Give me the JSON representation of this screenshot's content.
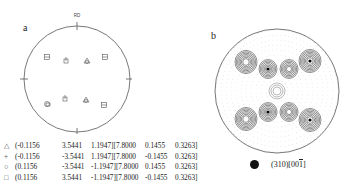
{
  "figure_a": {
    "label": "a",
    "axis_label_top": "RD",
    "symbols": [
      {
        "type": "square-hatched",
        "pos": "upper-left"
      },
      {
        "type": "cross",
        "pos": "upper-inner-left"
      },
      {
        "type": "triangle",
        "pos": "upper-inner-right"
      },
      {
        "type": "square",
        "pos": "upper-right"
      },
      {
        "type": "circle",
        "pos": "lower-left"
      },
      {
        "type": "cross",
        "pos": "lower-inner-left"
      },
      {
        "type": "triangle",
        "pos": "lower-inner-right"
      },
      {
        "type": "square",
        "pos": "lower-right"
      }
    ],
    "orientations": [
      {
        "symbol": "△",
        "values": [
          "(-0.1156",
          "3.5441",
          "1.1947][7.8000",
          "0.1455",
          "0.3263]"
        ]
      },
      {
        "symbol": "+",
        "values": [
          "(-0.1156",
          "-3.5441",
          "1.1947][7.8000",
          "-0.1455",
          "0.3263]"
        ]
      },
      {
        "symbol": "○",
        "values": [
          "(0.1156",
          "-3.5441",
          "-1.1947][7.8000",
          "0.1455",
          "0.3263]"
        ]
      },
      {
        "symbol": "□",
        "values": [
          "(0.1156",
          "3.5441",
          "-1.1947][7.8000",
          "-0.1455",
          "0.3263]"
        ]
      }
    ]
  },
  "figure_b": {
    "label": "b",
    "legend_text_main": "(310)[00",
    "legend_text_overline": "1",
    "legend_text_end": "]",
    "line_color": "#333333"
  }
}
